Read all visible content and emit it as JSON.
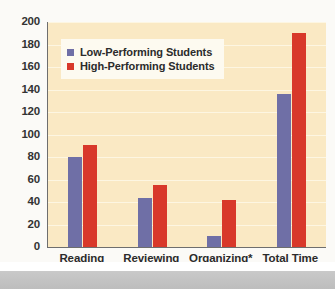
{
  "chart_data": {
    "type": "bar",
    "title": "",
    "xlabel": "",
    "ylabel": "",
    "ylim": [
      0,
      200
    ],
    "ytick_step": 20,
    "yticks": [
      "200",
      "180",
      "160",
      "140",
      "120",
      "100",
      "80",
      "60",
      "40",
      "20",
      "0"
    ],
    "grid": true,
    "legend_position": "upper-left-inside",
    "categories": [
      "Reading",
      "Reviewing",
      "Organizing*",
      "Total Time Studying*"
    ],
    "series": [
      {
        "name": "Low-Performing Students",
        "color": "#6f6fa6",
        "values": [
          80,
          44,
          10,
          136
        ]
      },
      {
        "name": "High-Performing Students",
        "color": "#d8382a",
        "values": [
          91,
          55,
          42,
          190
        ]
      }
    ]
  },
  "legend": {
    "items": [
      {
        "label": "Low-Performing Students",
        "color": "#6f6fa6"
      },
      {
        "label": "High-Performing Students",
        "color": "#d8382a"
      }
    ]
  },
  "axis": {
    "y_labels": [
      "200",
      "180",
      "160",
      "140",
      "120",
      "100",
      "80",
      "60",
      "40",
      "20",
      "0"
    ],
    "x_labels": [
      "Reading",
      "Reviewing",
      "Organizing*",
      "Total Time Studying*"
    ]
  },
  "colors": {
    "low_performing": "#6f6fa6",
    "high_performing": "#d8382a",
    "plot_background": "#fae9c4",
    "gridline": "#fdf6e2",
    "axis_line": "#6e6e6e",
    "text": "#2b2b2b"
  }
}
